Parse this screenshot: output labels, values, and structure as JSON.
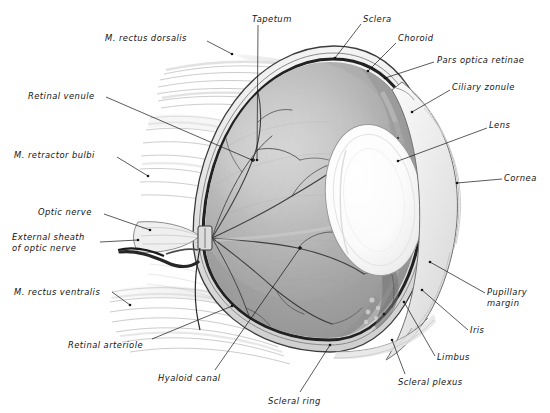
{
  "figure": {
    "kind": "anatomical-illustration",
    "style": "graphite pencil / halftone plate",
    "background_color": "#ffffff",
    "ink_color": "#141414"
  },
  "palette": {
    "paper": "#ffffff",
    "ink": "#141414",
    "sclera_outer": "#e9e9e9",
    "sclera_band": "#cfcfcf",
    "choroid_dark": "#2b2b2b",
    "retina_mid": "#a8a8a8",
    "retina_light": "#c2c2c2",
    "retina_shadow": "#8c8c8c",
    "tapetum": "#b9b9b9",
    "lens_white": "#fdfdfd",
    "lens_edge": "#d8d8d8",
    "muscle_light": "#ededed",
    "muscle_line": "#b4b4b4",
    "vessel": "#3a3a3a",
    "cornea_glass": "#f2f2f2"
  },
  "labels": [
    {
      "id": "m-rectus-dorsalis",
      "text": "M. rectus dorsalis",
      "lines": [
        "M. rectus dorsalis"
      ],
      "x": 105,
      "y": 33,
      "align": "left",
      "leader": [
        [
          207,
          41
        ],
        [
          232,
          54
        ]
      ]
    },
    {
      "id": "tapetum",
      "text": "Tapetum",
      "lines": [
        "Tapetum"
      ],
      "x": 252,
      "y": 14,
      "align": "left",
      "leader": [
        [
          258,
          25
        ],
        [
          257,
          160
        ]
      ]
    },
    {
      "id": "sclera",
      "text": "Sclera",
      "lines": [
        "Sclera"
      ],
      "x": 363,
      "y": 14,
      "align": "left",
      "leader": [
        [
          361,
          24
        ],
        [
          335,
          58
        ]
      ]
    },
    {
      "id": "choroid",
      "text": "Choroid",
      "lines": [
        "Choroid"
      ],
      "x": 398,
      "y": 33,
      "align": "left",
      "leader": [
        [
          396,
          43
        ],
        [
          368,
          71
        ]
      ]
    },
    {
      "id": "pars-optica-retinae",
      "text": "Pars optica retinae",
      "lines": [
        "Pars optica retinae"
      ],
      "x": 437,
      "y": 55,
      "align": "left",
      "leader": [
        [
          434,
          62
        ],
        [
          385,
          78
        ]
      ]
    },
    {
      "id": "ciliary-zonule",
      "text": "Ciliary zonule",
      "lines": [
        "Ciliary zonule"
      ],
      "x": 452,
      "y": 82,
      "align": "left",
      "leader": [
        [
          450,
          90
        ],
        [
          412,
          112
        ]
      ]
    },
    {
      "id": "lens",
      "text": "Lens",
      "lines": [
        "Lens"
      ],
      "x": 489,
      "y": 120,
      "align": "left",
      "leader": [
        [
          487,
          128
        ],
        [
          398,
          161
        ]
      ]
    },
    {
      "id": "cornea",
      "text": "Cornea",
      "lines": [
        "Cornea"
      ],
      "x": 504,
      "y": 173,
      "align": "left",
      "leader": [
        [
          502,
          179
        ],
        [
          457,
          183
        ]
      ]
    },
    {
      "id": "pupillary-margin",
      "text": "Pupillary margin",
      "lines": [
        "Pupillary",
        "margin"
      ],
      "x": 487,
      "y": 287,
      "align": "left",
      "leader": [
        [
          485,
          293
        ],
        [
          430,
          262
        ]
      ]
    },
    {
      "id": "iris",
      "text": "Iris",
      "lines": [
        "Iris"
      ],
      "x": 470,
      "y": 325,
      "align": "left",
      "leader": [
        [
          468,
          330
        ],
        [
          422,
          290
        ]
      ]
    },
    {
      "id": "limbus",
      "text": "Limbus",
      "lines": [
        "Limbus"
      ],
      "x": 437,
      "y": 352,
      "align": "left",
      "leader": [
        [
          435,
          356
        ],
        [
          404,
          302
        ]
      ]
    },
    {
      "id": "scleral-plexus",
      "text": "Scleral plexus",
      "lines": [
        "Scleral plexus"
      ],
      "x": 398,
      "y": 377,
      "align": "left",
      "leader": [
        [
          405,
          374
        ],
        [
          392,
          340
        ]
      ]
    },
    {
      "id": "scleral-ring",
      "text": "Scleral ring",
      "lines": [
        "Scleral ring"
      ],
      "x": 268,
      "y": 396,
      "align": "left",
      "leader": [
        [
          300,
          392
        ],
        [
          330,
          345
        ]
      ]
    },
    {
      "id": "hyaloid-canal",
      "text": "Hyaloid canal",
      "lines": [
        "Hyaloid canal"
      ],
      "x": 158,
      "y": 373,
      "align": "left",
      "leader": [
        [
          215,
          370
        ],
        [
          300,
          248
        ]
      ]
    },
    {
      "id": "retinal-arteriole",
      "text": "Retinal arteriole",
      "lines": [
        "Retinal arteriole"
      ],
      "x": 68,
      "y": 340,
      "align": "left",
      "leader": [
        [
          152,
          339
        ],
        [
          232,
          306
        ]
      ]
    },
    {
      "id": "m-rectus-ventralis",
      "text": "M. rectus ventralis",
      "lines": [
        "M. rectus ventralis"
      ],
      "x": 14,
      "y": 287,
      "align": "left",
      "leader": [
        [
          112,
          292
        ],
        [
          130,
          305
        ]
      ]
    },
    {
      "id": "external-sheath-of-optic-nerve",
      "text": "External sheath of optic nerve",
      "lines": [
        "External sheath",
        "of optic nerve"
      ],
      "x": 12,
      "y": 232,
      "align": "left",
      "leader": [
        [
          100,
          242
        ],
        [
          138,
          240
        ]
      ]
    },
    {
      "id": "optic-nerve",
      "text": "Optic nerve",
      "lines": [
        "Optic nerve"
      ],
      "x": 38,
      "y": 207,
      "align": "left",
      "leader": [
        [
          104,
          214
        ],
        [
          150,
          230
        ]
      ]
    },
    {
      "id": "m-retractor-bulbi",
      "text": "M. retractor bulbi",
      "lines": [
        "M. retractor bulbi"
      ],
      "x": 14,
      "y": 150,
      "align": "left",
      "leader": [
        [
          117,
          157
        ],
        [
          148,
          176
        ]
      ]
    },
    {
      "id": "retinal-venule",
      "text": "Retinal venule",
      "lines": [
        "Retinal venule"
      ],
      "x": 28,
      "y": 91,
      "align": "left",
      "leader": [
        [
          106,
          97
        ],
        [
          252,
          160
        ]
      ]
    }
  ],
  "structures": [
    {
      "id": "sclera-shell",
      "name": "Sclera",
      "note": "outer fibrous tunic, pale band"
    },
    {
      "id": "choroid-layer",
      "name": "Choroid",
      "note": "dark pigmented vascular layer"
    },
    {
      "id": "retina-interior",
      "name": "Pars optica retinae",
      "note": "gray inner lining"
    },
    {
      "id": "tapetum-patch",
      "name": "Tapetum",
      "note": "lighter reflective fundus patch, dorsal"
    },
    {
      "id": "lens-body",
      "name": "Lens",
      "note": "large white biconvex ellipse"
    },
    {
      "id": "cornea-arc",
      "name": "Cornea",
      "note": "transparent anterior arcs"
    },
    {
      "id": "iris-ciliary",
      "name": "Iris & ciliary body",
      "note": "pigmented with zonule fibers"
    },
    {
      "id": "optic-nerve-stump",
      "name": "Optic nerve",
      "note": "cut stump with external sheath"
    },
    {
      "id": "retinal-vessels",
      "name": "Retinal vessels",
      "note": "branching arterioles and venules"
    },
    {
      "id": "extraocular-muscles",
      "name": "Extraocular muscles",
      "note": "rectus dorsalis, rectus ventralis, retractor bulbi"
    }
  ]
}
